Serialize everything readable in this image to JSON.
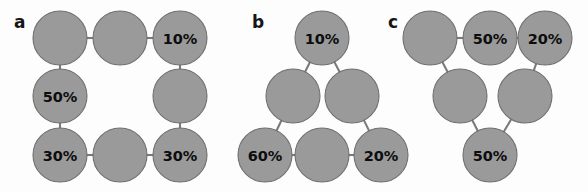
{
  "figure": {
    "width": 588,
    "height": 192,
    "background_color": "#fdfdfd",
    "node_fill_color": "#9a9a9a",
    "node_stroke_color": "#6f6f6f",
    "edge_color": "#7a7a7a",
    "label_color": "#0d0d0d",
    "node_radius": 27
  },
  "panels": [
    {
      "id": "a",
      "label": "a",
      "label_x": 14,
      "label_y": 28,
      "nodes": [
        {
          "id": "a1",
          "label": "",
          "cx": 60,
          "cy": 38
        },
        {
          "id": "a2",
          "label": "",
          "cx": 120,
          "cy": 38
        },
        {
          "id": "a3",
          "label": "10%",
          "cx": 180,
          "cy": 38
        },
        {
          "id": "a4",
          "label": "50%",
          "cx": 60,
          "cy": 96
        },
        {
          "id": "a5",
          "label": "",
          "cx": 180,
          "cy": 96
        },
        {
          "id": "a6",
          "label": "30%",
          "cx": 60,
          "cy": 155
        },
        {
          "id": "a7",
          "label": "",
          "cx": 120,
          "cy": 155
        },
        {
          "id": "a8",
          "label": "30%",
          "cx": 180,
          "cy": 155
        }
      ],
      "edges": [
        {
          "from": "a1",
          "to": "a2"
        },
        {
          "from": "a2",
          "to": "a3"
        },
        {
          "from": "a1",
          "to": "a4"
        },
        {
          "from": "a3",
          "to": "a5"
        },
        {
          "from": "a4",
          "to": "a6"
        },
        {
          "from": "a5",
          "to": "a8"
        },
        {
          "from": "a6",
          "to": "a7"
        },
        {
          "from": "a7",
          "to": "a8"
        }
      ]
    },
    {
      "id": "b",
      "label": "b",
      "label_x": 252,
      "label_y": 28,
      "nodes": [
        {
          "id": "b1",
          "label": "10%",
          "cx": 322,
          "cy": 38
        },
        {
          "id": "b2",
          "label": "",
          "cx": 293,
          "cy": 96
        },
        {
          "id": "b3",
          "label": "",
          "cx": 352,
          "cy": 96
        },
        {
          "id": "b4",
          "label": "60%",
          "cx": 265,
          "cy": 155
        },
        {
          "id": "b5",
          "label": "",
          "cx": 322,
          "cy": 155
        },
        {
          "id": "b6",
          "label": "20%",
          "cx": 381,
          "cy": 155
        }
      ],
      "edges": [
        {
          "from": "b1",
          "to": "b2"
        },
        {
          "from": "b1",
          "to": "b3"
        },
        {
          "from": "b2",
          "to": "b4"
        },
        {
          "from": "b3",
          "to": "b6"
        },
        {
          "from": "b4",
          "to": "b5"
        },
        {
          "from": "b5",
          "to": "b6"
        }
      ]
    },
    {
      "id": "c",
      "label": "c",
      "label_x": 388,
      "label_y": 28,
      "nodes": [
        {
          "id": "c1",
          "label": "",
          "cx": 430,
          "cy": 38
        },
        {
          "id": "c2",
          "label": "50%",
          "cx": 490,
          "cy": 38
        },
        {
          "id": "c3",
          "label": "20%",
          "cx": 545,
          "cy": 38
        },
        {
          "id": "c4",
          "label": "",
          "cx": 460,
          "cy": 96
        },
        {
          "id": "c5",
          "label": "",
          "cx": 525,
          "cy": 96
        },
        {
          "id": "c6",
          "label": "50%",
          "cx": 490,
          "cy": 155
        }
      ],
      "edges": [
        {
          "from": "c1",
          "to": "c2"
        },
        {
          "from": "c2",
          "to": "c3"
        },
        {
          "from": "c1",
          "to": "c4"
        },
        {
          "from": "c3",
          "to": "c5"
        },
        {
          "from": "c4",
          "to": "c6"
        },
        {
          "from": "c5",
          "to": "c6"
        }
      ]
    }
  ]
}
